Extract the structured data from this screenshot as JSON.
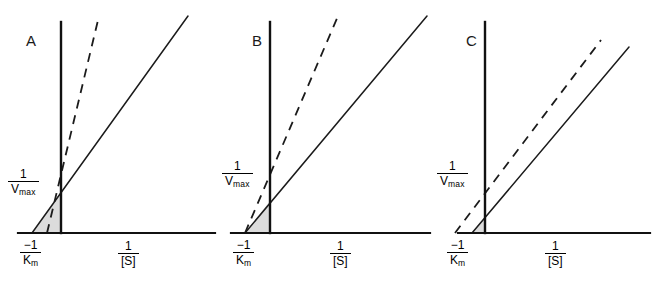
{
  "figure": {
    "type": "lineweaver-burk-triptych",
    "background": "#ffffff",
    "ink_color": "#1b1b1b",
    "shade_color": "#dcdcdc"
  },
  "labels": {
    "y_axis_num": "1",
    "y_axis_den": "V",
    "y_axis_den_sub": "max",
    "x_intercept_num": "−1",
    "x_intercept_den": "K",
    "x_intercept_den_sub": "m",
    "x_axis_num": "1",
    "x_axis_den": "[S]"
  },
  "panels": [
    {
      "letter": "A",
      "letter_x": 26,
      "letter_y": 46,
      "origin_x": 61,
      "baseline_y": 233,
      "axis_top_y": 22,
      "axis_right_x": 215,
      "y_intercept_label_x": 8,
      "y_intercept_label_y": 168,
      "x_intercept_label_x": 20,
      "x_intercept_label_y": 239,
      "x_axis_label_x": 118,
      "x_axis_label_y": 240,
      "solid": {
        "x1": 32,
        "y1": 233,
        "x2": 188,
        "y2": 16
      },
      "dashed": {
        "x1": 47,
        "y1": 233,
        "x2": 99,
        "y2": 16
      },
      "shade": [
        [
          32,
          233
        ],
        [
          61,
          193
        ],
        [
          61,
          233
        ]
      ],
      "tick_y": 193
    },
    {
      "letter": "B",
      "letter_x": 252,
      "letter_y": 46,
      "origin_x": 270,
      "baseline_y": 233,
      "axis_top_y": 22,
      "axis_right_x": 430,
      "y_intercept_label_x": 222,
      "y_intercept_label_y": 160,
      "x_intercept_label_x": 233,
      "x_intercept_label_y": 239,
      "x_axis_label_x": 330,
      "x_axis_label_y": 240,
      "solid": {
        "x1": 245,
        "y1": 233,
        "x2": 427,
        "y2": 16
      },
      "dashed": {
        "x1": 245,
        "y1": 233,
        "x2": 338,
        "y2": 16
      },
      "shade": [
        [
          245,
          233
        ],
        [
          270,
          201
        ],
        [
          270,
          233
        ]
      ],
      "tick_y": 201
    },
    {
      "letter": "C",
      "letter_x": 466,
      "letter_y": 46,
      "origin_x": 485,
      "baseline_y": 233,
      "axis_top_y": 22,
      "axis_right_x": 650,
      "y_intercept_label_x": 437,
      "y_intercept_label_y": 160,
      "x_intercept_label_x": 447,
      "x_intercept_label_y": 239,
      "x_axis_label_x": 545,
      "x_axis_label_y": 240,
      "solid": {
        "x1": 472,
        "y1": 233,
        "x2": 629,
        "y2": 47
      },
      "dashed": {
        "x1": 455,
        "y1": 233,
        "x2": 601,
        "y2": 40
      },
      "shade": [
        [
          472,
          233
        ],
        [
          485,
          218
        ],
        [
          485,
          233
        ]
      ],
      "tick_y": 188
    }
  ],
  "chart_data": {
    "type": "line",
    "title": "",
    "xlabel": "1/[S]",
    "ylabel": "1/V",
    "panel_count": 3,
    "series_names": [
      "uninhibited (solid)",
      "inhibited (dashed)"
    ],
    "panels": [
      {
        "label": "A",
        "description": "Both lines share the same 1/Vmax y-intercept; dashed line has a steeper slope and a less negative x-intercept.",
        "series": [
          {
            "name": "uninhibited (solid)",
            "y_intercept": "1/Vmax",
            "x_intercept": "-1/Km",
            "slope": "Km/Vmax",
            "style": "solid"
          },
          {
            "name": "inhibited (dashed)",
            "y_intercept": "1/Vmax",
            "x_intercept": "-1/(alpha*Km)",
            "slope": "alpha*Km/Vmax",
            "style": "dashed"
          }
        ]
      },
      {
        "label": "B",
        "description": "Both lines share the same -1/Km x-intercept; dashed line has a higher y-intercept and steeper slope.",
        "series": [
          {
            "name": "uninhibited (solid)",
            "y_intercept": "1/Vmax",
            "x_intercept": "-1/Km",
            "slope": "Km/Vmax",
            "style": "solid"
          },
          {
            "name": "inhibited (dashed)",
            "y_intercept": "alpha/Vmax",
            "x_intercept": "-1/Km",
            "slope": "alpha*Km/Vmax",
            "style": "dashed"
          }
        ]
      },
      {
        "label": "C",
        "description": "Lines are parallel; dashed line is shifted left with a more negative x-intercept and the same slope.",
        "series": [
          {
            "name": "uninhibited (solid)",
            "y_intercept": "1/Vmax",
            "x_intercept": "-1/Km",
            "slope": "Km/Vmax",
            "style": "solid"
          },
          {
            "name": "inhibited (dashed)",
            "y_intercept": "1/(alpha*Vmax)",
            "x_intercept": "-1/(alpha*Km)",
            "slope": "Km/Vmax",
            "style": "dashed"
          }
        ]
      }
    ],
    "grid": false,
    "legend": "none"
  }
}
